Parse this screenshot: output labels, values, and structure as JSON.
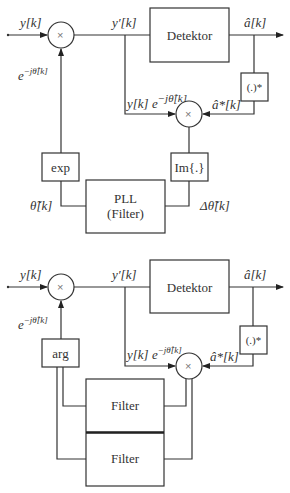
{
  "diagram_top": {
    "input_label": "y[k]",
    "rotated_label": "y′[k]",
    "detector_label": "Detektor",
    "output_label": "â[k]",
    "conj_label": "(.)*",
    "conj_output_label": "â*[k]",
    "product_label": "y[k] e^{−jθ̂[k]}",
    "product_text_a": "y[k] e",
    "product_text_sup": "−jθ̂[k]",
    "phasor_label_base": "e",
    "phasor_label_sup": "−jθ̂[k]",
    "exp_label": "exp",
    "im_label": "Im{.}",
    "pll_label_line1": "PLL",
    "pll_label_line2": "(Filter)",
    "theta_label": "θ̃[k]",
    "delta_theta_label": "Δθ̃[k]",
    "multiplier_symbol": "×"
  },
  "diagram_bottom": {
    "input_label": "y[k]",
    "rotated_label": "y′[k]",
    "detector_label": "Detektor",
    "output_label": "â[k]",
    "conj_label": "(.)*",
    "conj_output_label": "â*[k]",
    "product_text_a": "y[k] e",
    "product_text_sup": "−jθ̂[k]",
    "phasor_label_base": "e",
    "phasor_label_sup": "−jθ̂[k]",
    "arg_label": "arg",
    "filter1_label": "Filter",
    "filter2_label": "Filter",
    "multiplier_symbol": "×"
  }
}
